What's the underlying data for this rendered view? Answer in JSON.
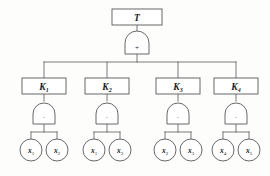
{
  "diagram": {
    "background_color": "#fdfdfc",
    "stroke_color": "#58585a",
    "text_color": "#1a1a1a"
  },
  "top_event": {
    "label": "T",
    "shape": "rectangle",
    "gate": {
      "type": "or-gate",
      "symbol": "+"
    }
  },
  "cut_sets": [
    {
      "label": "K",
      "subscript": "1",
      "gate": {
        "type": "and-gate",
        "symbol": "·"
      },
      "basic_events": [
        {
          "label": "x",
          "subscript": "1"
        },
        {
          "label": "x",
          "subscript": "2"
        }
      ]
    },
    {
      "label": "K",
      "subscript": "2",
      "gate": {
        "type": "and-gate",
        "symbol": "·"
      },
      "basic_events": [
        {
          "label": "x",
          "subscript": "1"
        },
        {
          "label": "x",
          "subscript": "3"
        }
      ]
    },
    {
      "label": "K",
      "subscript": "3",
      "gate": {
        "type": "and-gate",
        "symbol": "·"
      },
      "basic_events": [
        {
          "label": "x",
          "subscript": "2"
        },
        {
          "label": "x",
          "subscript": "3"
        }
      ]
    },
    {
      "label": "K",
      "subscript": "4",
      "gate": {
        "type": "and-gate",
        "symbol": "·"
      },
      "basic_events": [
        {
          "label": "x",
          "subscript": "4"
        },
        {
          "label": "x",
          "subscript": "5"
        }
      ]
    }
  ]
}
